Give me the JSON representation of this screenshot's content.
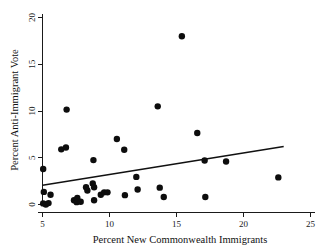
{
  "chart_data": {
    "type": "scatter",
    "title": "",
    "xlabel": "Percent New Commonwealth Immigrants",
    "ylabel": "Percent Anti-Immigrant Vote",
    "xlim": [
      4.2,
      25.6
    ],
    "ylim": [
      -0.8,
      20.4
    ],
    "xticks": [
      5,
      10,
      15,
      20,
      25
    ],
    "xtick_labels": [
      "5",
      "10",
      "15",
      "20",
      "25"
    ],
    "yticks": [
      0,
      5,
      10,
      15,
      20
    ],
    "ytick_labels": [
      "0",
      "5",
      "10",
      "15",
      "20"
    ],
    "grid": false,
    "legend": false,
    "marker": "filled-circle",
    "marker_color": "#0d0d0d",
    "marker_size": 3.2,
    "points": [
      {
        "x": 5.05,
        "y": 3.8
      },
      {
        "x": 5.1,
        "y": 1.35
      },
      {
        "x": 5.05,
        "y": 0.12
      },
      {
        "x": 5.25,
        "y": 0.0
      },
      {
        "x": 5.45,
        "y": 0.15
      },
      {
        "x": 5.6,
        "y": 1.05
      },
      {
        "x": 6.4,
        "y": 5.9
      },
      {
        "x": 6.75,
        "y": 6.1
      },
      {
        "x": 6.8,
        "y": 10.15
      },
      {
        "x": 7.35,
        "y": 0.45
      },
      {
        "x": 7.55,
        "y": 0.25
      },
      {
        "x": 7.6,
        "y": 0.7
      },
      {
        "x": 7.85,
        "y": 0.3
      },
      {
        "x": 8.25,
        "y": 1.85
      },
      {
        "x": 8.35,
        "y": 1.5
      },
      {
        "x": 8.75,
        "y": 2.25
      },
      {
        "x": 8.8,
        "y": 4.75
      },
      {
        "x": 8.85,
        "y": 1.85
      },
      {
        "x": 8.85,
        "y": 0.45
      },
      {
        "x": 9.35,
        "y": 1.05
      },
      {
        "x": 9.6,
        "y": 1.3
      },
      {
        "x": 9.85,
        "y": 1.3
      },
      {
        "x": 10.55,
        "y": 7.0
      },
      {
        "x": 11.1,
        "y": 5.85
      },
      {
        "x": 11.15,
        "y": 1.0
      },
      {
        "x": 12.0,
        "y": 2.95
      },
      {
        "x": 12.1,
        "y": 1.6
      },
      {
        "x": 13.6,
        "y": 10.5
      },
      {
        "x": 13.75,
        "y": 1.8
      },
      {
        "x": 14.05,
        "y": 0.8
      },
      {
        "x": 15.4,
        "y": 18.0
      },
      {
        "x": 16.55,
        "y": 7.65
      },
      {
        "x": 17.1,
        "y": 4.7
      },
      {
        "x": 17.15,
        "y": 0.8
      },
      {
        "x": 18.7,
        "y": 4.6
      },
      {
        "x": 22.6,
        "y": 2.9
      }
    ],
    "fit_line": {
      "name": "linear-fit",
      "x_start": 5.0,
      "y_start": 2.05,
      "x_end": 23.0,
      "y_end": 6.2,
      "color": "#111111"
    }
  }
}
